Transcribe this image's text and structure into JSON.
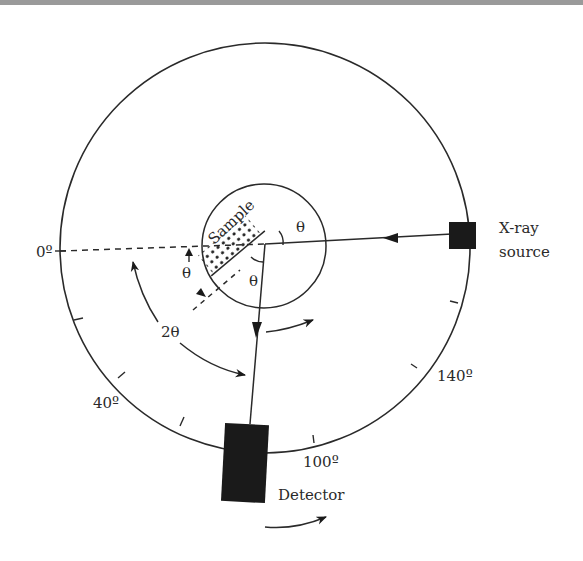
{
  "figure": {
    "colors": {
      "line": "#2a2a2a",
      "fill": "#1a1a1a",
      "topbar": "#9a9a9a"
    }
  },
  "labels": {
    "zero_deg": "0º",
    "forty_deg": "40º",
    "hundred_deg": "100º",
    "one_forty_deg": "140º",
    "sample": "Sample",
    "theta_top": "θ",
    "theta_left": "θ",
    "theta_center": "θ",
    "two_theta": "2θ",
    "xray_line1": "X-ray",
    "xray_line2": "source",
    "detector": "Detector"
  },
  "components": [
    {
      "name": "goniometer-circle",
      "type": "outer circle"
    },
    {
      "name": "sample-stage",
      "type": "inner circle"
    },
    {
      "name": "sample",
      "type": "dotted flat specimen"
    },
    {
      "name": "xray-source",
      "type": "filled square"
    },
    {
      "name": "detector",
      "type": "filled rectangle"
    }
  ]
}
